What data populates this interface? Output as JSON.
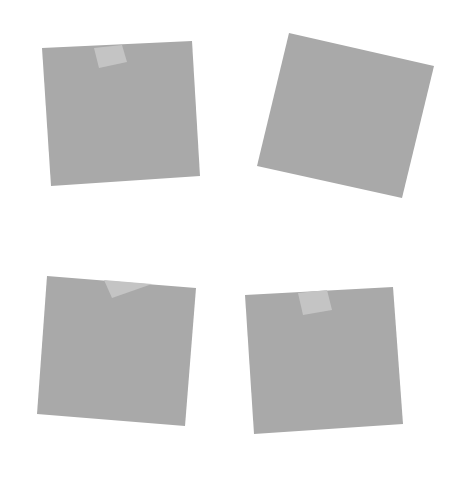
{
  "canvas": {
    "width": 459,
    "height": 482,
    "background": "#ffffff"
  },
  "colors": {
    "card": "#a9a9a9",
    "tape": "#c4c4c4"
  },
  "cards": [
    {
      "id": "card-top-left",
      "points": [
        [
          42,
          48
        ],
        [
          192,
          41
        ],
        [
          200,
          176
        ],
        [
          51,
          186
        ]
      ],
      "tape": [
        [
          94,
          48
        ],
        [
          122,
          45
        ],
        [
          127,
          62
        ],
        [
          99,
          68
        ]
      ]
    },
    {
      "id": "card-top-right",
      "points": [
        [
          289,
          33
        ],
        [
          434,
          66
        ],
        [
          402,
          198
        ],
        [
          257,
          166
        ]
      ],
      "tape": null
    },
    {
      "id": "card-bottom-left",
      "points": [
        [
          47,
          276
        ],
        [
          196,
          288
        ],
        [
          185,
          426
        ],
        [
          37,
          414
        ]
      ],
      "tape": [
        [
          104,
          280
        ],
        [
          152,
          284
        ],
        [
          112,
          298
        ]
      ]
    },
    {
      "id": "card-bottom-right",
      "points": [
        [
          245,
          295
        ],
        [
          393,
          287
        ],
        [
          403,
          424
        ],
        [
          254,
          434
        ]
      ],
      "tape": [
        [
          298,
          293
        ],
        [
          327,
          290
        ],
        [
          332,
          310
        ],
        [
          303,
          315
        ]
      ]
    }
  ]
}
